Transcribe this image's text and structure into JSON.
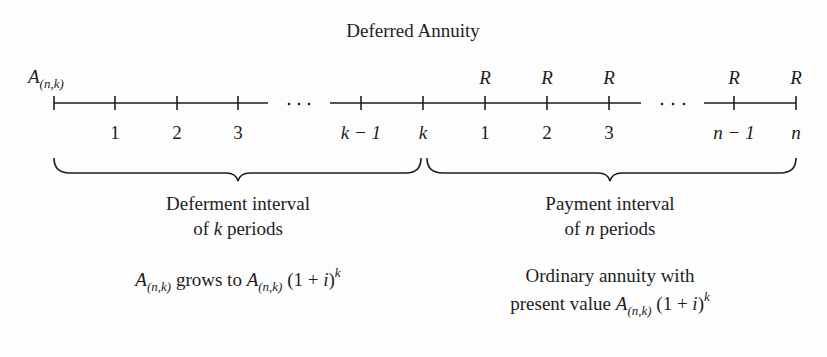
{
  "title": "Deferred Annuity",
  "start_label": {
    "base": "A",
    "sub": "(n,k)"
  },
  "timeline": {
    "deferment_ticks": [
      "1",
      "2",
      "3",
      "k − 1",
      "k"
    ],
    "payment_ticks": [
      "1",
      "2",
      "3",
      "n − 1",
      "n"
    ],
    "payment_symbol": "R",
    "ellipsis": "· · ·"
  },
  "deferment": {
    "line1": "Deferment interval",
    "line2_pre": "of ",
    "line2_var": "k",
    "line2_post": " periods",
    "formula": {
      "a1": "A",
      "a1_sub": "(n,k)",
      "mid": " grows to ",
      "a2": "A",
      "a2_sub": "(n,k)",
      "tail": " (1 + ",
      "i": "i",
      "close": ")",
      "exp": "k"
    }
  },
  "payment": {
    "line1": "Payment interval",
    "line2_pre": "of ",
    "line2_var": "n",
    "line2_post": " periods",
    "line3": "Ordinary annuity with",
    "formula": {
      "pre": "present value ",
      "a": "A",
      "a_sub": "(n,k)",
      "tail": " (1 + ",
      "i": "i",
      "close": ")",
      "exp": "k"
    }
  },
  "colors": {
    "ink": "#1d1d1d",
    "background": "#fdfdfd"
  }
}
